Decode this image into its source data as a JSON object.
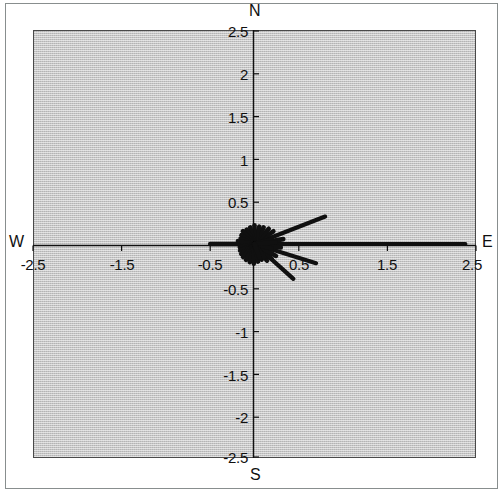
{
  "figure": {
    "title": "",
    "panel_color": "#c5c5c5",
    "frame_color": "#4a4a4a",
    "line_color": "#101010"
  },
  "compass": {
    "north": "N",
    "south": "S",
    "east": "E",
    "west": "W"
  },
  "axes": {
    "x_ticks": [
      "-2.5",
      "-1.5",
      "-0.5",
      "0.5",
      "1.5",
      "2.5"
    ],
    "y_ticks": [
      "2.5",
      "2",
      "1.5",
      "1",
      "0.5",
      "-0.5",
      "-1",
      "-1.5",
      "-2",
      "-2.5"
    ]
  },
  "chart_data": {
    "type": "line",
    "subtype": "compass-rose-feather-plot",
    "title": "",
    "xlabel": "",
    "ylabel": "",
    "xlim": [
      -2.5,
      2.5
    ],
    "ylim": [
      -2.5,
      2.5
    ],
    "grid": false,
    "legend": "none",
    "xticks": [
      -2.5,
      -1.5,
      -0.5,
      0.5,
      1.5,
      2.5
    ],
    "yticks": [
      2.5,
      2,
      1.5,
      1,
      0.5,
      -0.5,
      -1,
      -1.5,
      -2,
      -2.5
    ],
    "axis_labels": {
      "top": "N",
      "bottom": "S",
      "left": "W",
      "right": "E"
    },
    "origin": [
      0,
      0
    ],
    "rays_polar_deg_r": [
      [
        0,
        2.38
      ],
      [
        22,
        0.86
      ],
      [
        -18,
        0.73
      ],
      [
        -43,
        0.6
      ],
      [
        180,
        0.5
      ],
      [
        10,
        0.33
      ],
      [
        -8,
        0.3
      ],
      [
        -30,
        0.28
      ],
      [
        35,
        0.26
      ],
      [
        48,
        0.24
      ],
      [
        62,
        0.22
      ],
      [
        75,
        0.21
      ],
      [
        90,
        0.22
      ],
      [
        104,
        0.2
      ],
      [
        118,
        0.19
      ],
      [
        131,
        0.2
      ],
      [
        145,
        0.18
      ],
      [
        158,
        0.17
      ],
      [
        170,
        0.19
      ],
      [
        192,
        0.17
      ],
      [
        205,
        0.18
      ],
      [
        218,
        0.19
      ],
      [
        230,
        0.2
      ],
      [
        243,
        0.21
      ],
      [
        256,
        0.22
      ],
      [
        268,
        0.23
      ],
      [
        281,
        0.21
      ],
      [
        294,
        0.2
      ],
      [
        306,
        0.24
      ],
      [
        318,
        0.26
      ],
      [
        330,
        0.22
      ],
      [
        345,
        0.2
      ],
      [
        15,
        0.2
      ],
      [
        5,
        0.24
      ],
      [
        -55,
        0.19
      ],
      [
        -70,
        0.17
      ]
    ]
  }
}
